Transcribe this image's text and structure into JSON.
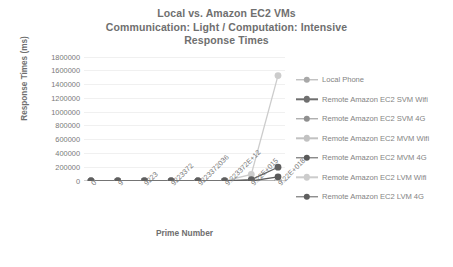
{
  "chart_data": {
    "type": "line",
    "title": "Local vs. Amazon EC2 VMs\nCommunication: Light / Computation: Intensive\nResponse Times",
    "title_lines": [
      "Local vs. Amazon EC2 VMs",
      "Communication: Light / Computation: Intensive",
      "Response Times"
    ],
    "xlabel": "Prime Number",
    "ylabel": "Response Times (ms)",
    "categories": [
      "0",
      "9",
      "9223",
      "9223372",
      "9223372036",
      "9.223372E+12",
      "9.22E+015",
      "9.22E+018"
    ],
    "ylim": [
      0,
      1800000
    ],
    "ytick_values": [
      1800000,
      1600000,
      1400000,
      1200000,
      1000000,
      800000,
      600000,
      400000,
      200000,
      0
    ],
    "ytick_labels": [
      "1800000",
      "1600000",
      "1400000",
      "1200000",
      "1000000",
      "800000",
      "600000",
      "400000",
      "200000",
      "0"
    ],
    "grid": true,
    "legend_position": "right",
    "series": [
      {
        "name": "Local Phone",
        "color": "#a8a8a8",
        "values": [
          0,
          0,
          0,
          0,
          0,
          0,
          0,
          0
        ]
      },
      {
        "name": "Remote Amazon EC2 SVM Wifi",
        "color": "#6f6f6f",
        "values": [
          0,
          0,
          0,
          0,
          0,
          0,
          0,
          0
        ]
      },
      {
        "name": "Remote Amazon EC2 SVM 4G",
        "color": "#8f8f8f",
        "values": [
          0,
          0,
          0,
          0,
          0,
          0,
          0,
          0
        ]
      },
      {
        "name": "Remote Amazon EC2 MVM Wifi",
        "color": "#c2c2c2",
        "values": [
          0,
          0,
          0,
          0,
          0,
          0,
          0,
          0
        ]
      },
      {
        "name": "Remote Amazon EC2 MVM 4G",
        "color": "#5a5a5a",
        "values": [
          0,
          0,
          0,
          0,
          0,
          0,
          0,
          60000
        ]
      },
      {
        "name": "Remote Amazon EC2 LVM Wifi",
        "color": "#cccccc",
        "values": [
          0,
          0,
          0,
          0,
          0,
          0,
          95000,
          1530000
        ]
      },
      {
        "name": "Remote Amazon EC2 LVM 4G",
        "color": "#5f5f5f",
        "values": [
          0,
          0,
          0,
          0,
          0,
          0,
          20000,
          200000
        ]
      }
    ]
  }
}
